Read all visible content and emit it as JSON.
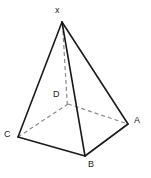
{
  "figure": {
    "name": "square-pyramid-diagram",
    "background_color": "#ffffff",
    "stroke_color": "#1a1a1a",
    "hidden_stroke_color": "#8a8a8a",
    "solid_stroke_width": 1.6,
    "dashed_stroke_width": 1.2,
    "dash_pattern": "4,3",
    "width": 151,
    "height": 178,
    "labels": {
      "apex": "x",
      "left_front": "C",
      "front": "B",
      "right": "A",
      "hidden_back": "D"
    },
    "vertices": [
      {
        "id": "X",
        "label": "x",
        "x": 62,
        "y": 22,
        "hidden": false,
        "label_x": 55,
        "label_y": 6
      },
      {
        "id": "C",
        "label": "C",
        "x": 18,
        "y": 137,
        "hidden": false,
        "label_x": 4,
        "label_y": 130
      },
      {
        "id": "B",
        "label": "B",
        "x": 85,
        "y": 156,
        "hidden": false,
        "label_x": 88,
        "label_y": 160
      },
      {
        "id": "A",
        "label": "A",
        "x": 128,
        "y": 124,
        "hidden": false,
        "label_x": 134,
        "label_y": 116
      },
      {
        "id": "D",
        "label": "D",
        "x": 68,
        "y": 104,
        "hidden": true,
        "label_x": 53,
        "label_y": 90
      }
    ],
    "edges": [
      {
        "id": "X-C",
        "from": "X",
        "to": "C",
        "style": "solid"
      },
      {
        "id": "X-A",
        "from": "X",
        "to": "A",
        "style": "solid"
      },
      {
        "id": "X-B",
        "from": "X",
        "to": "B",
        "style": "solid"
      },
      {
        "id": "C-B",
        "from": "C",
        "to": "B",
        "style": "solid"
      },
      {
        "id": "B-A",
        "from": "B",
        "to": "A",
        "style": "solid"
      },
      {
        "id": "X-D",
        "from": "X",
        "to": "D",
        "style": "dashed"
      },
      {
        "id": "C-D",
        "from": "C",
        "to": "D",
        "style": "dashed"
      },
      {
        "id": "D-A",
        "from": "D",
        "to": "A",
        "style": "dashed"
      }
    ]
  }
}
